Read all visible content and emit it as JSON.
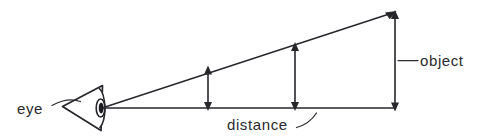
{
  "figure": {
    "kind": "line-diagram",
    "background_color": "#ffffff",
    "ink_color": "#26262b"
  },
  "labels": {
    "eye": "eye",
    "distance": "distance",
    "object": "object"
  },
  "icons": {
    "eye": "eye-cone-icon",
    "arrow_up": "arrow-up-icon",
    "arrow_down": "arrow-down-icon"
  },
  "geometry": {
    "eye_vertex": [
      103,
      108
    ],
    "baseline_end": [
      395,
      108
    ],
    "apex": [
      395,
      12
    ],
    "dimension_arrows": [
      {
        "name": "near-object-height",
        "x": 208,
        "top": 68,
        "bottom": 108
      },
      {
        "name": "mid-object-height",
        "x": 295,
        "top": 44,
        "bottom": 108
      },
      {
        "name": "far-object-height",
        "x": 395,
        "top": 12,
        "bottom": 108
      }
    ]
  }
}
